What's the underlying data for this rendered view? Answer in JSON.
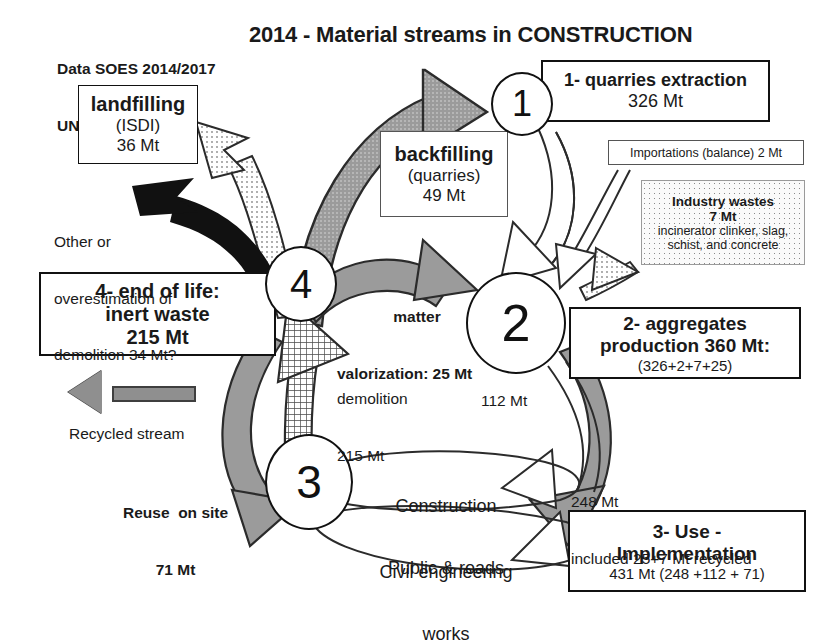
{
  "title": "2014 - Material streams in CONSTRUCTION",
  "source": {
    "line1": "Data SOES 2014/2017",
    "line2": "UNICEM 2014"
  },
  "nodes": {
    "n1": "1",
    "n2": "2",
    "n3": "3",
    "n4": "4"
  },
  "boxes": {
    "landfilling": {
      "l1": "landfilling",
      "l2": "(ISDI)",
      "l3": "36 Mt"
    },
    "backfilling": {
      "l1": "backfilling",
      "l2": "(quarries)",
      "l3": "49 Mt"
    },
    "quarries": {
      "l1": "1- quarries extraction",
      "l2": "326 Mt"
    },
    "importations": {
      "l1": "Importations (balance) 2 Mt"
    },
    "industry_wastes": {
      "l1": "Industry  wastes",
      "l2": "7 Mt",
      "l3": "incinerator clinker, slag,",
      "l4": "schist, and concrete"
    },
    "aggregates": {
      "l1": "2- aggregates",
      "l2": "production 360 Mt:",
      "l3": "(326+2+7+25)"
    },
    "end_of_life": {
      "l1": "4- end of life:",
      "l2": "inert waste",
      "l3": "215 Mt"
    },
    "use": {
      "l1": "3- Use -",
      "l2": "Implementation",
      "l3": "431 Mt  (248 +112 + 71)"
    }
  },
  "labels": {
    "other_over": {
      "l1": "Other or",
      "l2": "overestimation of",
      "l3": "demolition 34 Mt?"
    },
    "matter_valorization": {
      "l1": "matter",
      "l2": "valorization: 25 Mt"
    },
    "demolition": {
      "l1": "demolition",
      "l2": "215 Mt"
    },
    "flow_112": "112 Mt",
    "flow_248": {
      "l1": "248 Mt",
      "l2": "included 25+7 Mt recycled"
    },
    "reuse": {
      "l1": "Reuse  on site",
      "l2": "71 Mt"
    },
    "recycled_legend": "Recycled stream",
    "construction": {
      "l1": "Construction",
      "l2": "Civil engineering"
    },
    "public_works": {
      "l1": "Public & roads",
      "l2": "works"
    }
  },
  "colors": {
    "ink": "#111111",
    "gray_flow": "#8f8f8f",
    "gray_flow_dark": "#6f6f6f",
    "black_flow": "#111111",
    "stipple": "#8a8a8a",
    "white_flow": "#ffffff"
  }
}
